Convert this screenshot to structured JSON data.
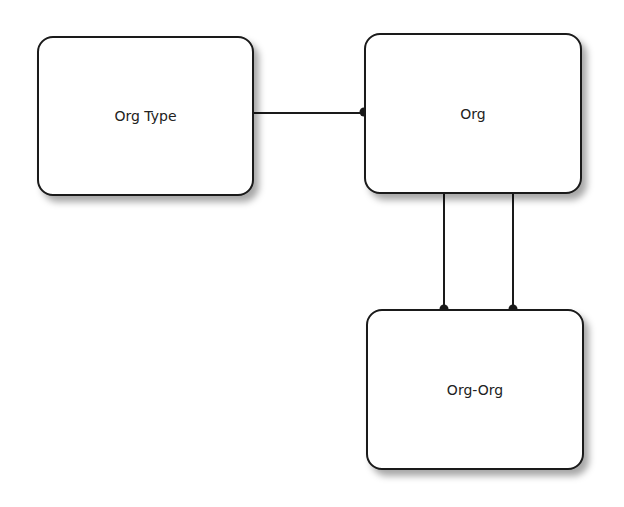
{
  "diagram": {
    "entities": [
      {
        "id": "org-type",
        "label": "Org Type"
      },
      {
        "id": "org",
        "label": "Org"
      },
      {
        "id": "org-org",
        "label": "Org-Org"
      }
    ],
    "relationships": [
      {
        "from": "Org Type",
        "to": "Org",
        "end": "dot-at-Org"
      },
      {
        "from": "Org",
        "to": "Org-Org",
        "end": "dot-at-Org-Org"
      },
      {
        "from": "Org",
        "to": "Org-Org",
        "end": "dot-at-Org-Org"
      }
    ],
    "colors": {
      "line": "#1a1a1a",
      "box_fill": "#ffffff"
    }
  }
}
